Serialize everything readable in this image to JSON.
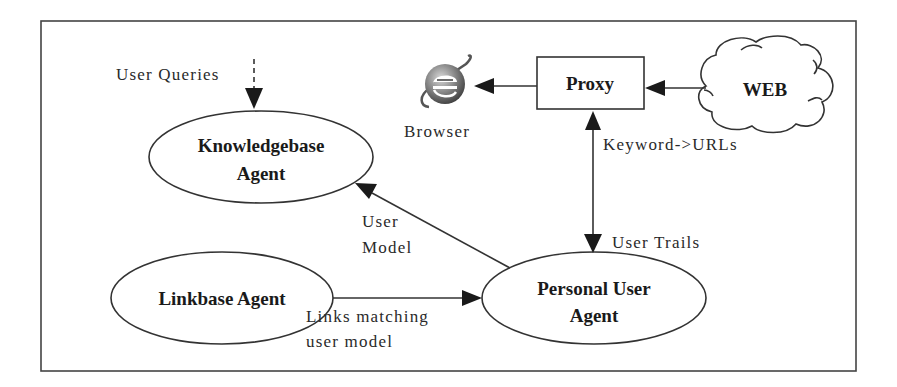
{
  "diagram": {
    "type": "architecture-flow",
    "nodes": {
      "knowledgebase": {
        "line1": "Knowledgebase",
        "line2": "Agent"
      },
      "linkbase": {
        "label": "Linkbase Agent"
      },
      "personal_user": {
        "line1": "Personal User",
        "line2": "Agent"
      },
      "proxy": {
        "label": "Proxy"
      },
      "web": {
        "label": "WEB"
      },
      "browser": {
        "label": "Browser",
        "icon": "browser-e-icon"
      }
    },
    "edges": {
      "user_queries": {
        "label": "User Queries",
        "from": "external",
        "to": "knowledgebase",
        "style": "dashed"
      },
      "user_model": {
        "line1": "User",
        "line2": "Model",
        "from": "personal_user",
        "to": "knowledgebase"
      },
      "links_matching": {
        "line1": "Links matching",
        "line2": "user model",
        "from": "linkbase",
        "to": "personal_user"
      },
      "user_trails": {
        "label": "User Trails",
        "from": "proxy",
        "to": "personal_user"
      },
      "keyword_urls": {
        "label": "Keyword->URLs",
        "from": "personal_user",
        "to": "proxy"
      },
      "proxy_to_browser": {
        "from": "proxy",
        "to": "browser"
      },
      "web_to_proxy": {
        "from": "web",
        "to": "proxy"
      }
    },
    "colors": {
      "stroke": "#333333",
      "text": "#1a1a1a",
      "background": "#ffffff"
    }
  }
}
